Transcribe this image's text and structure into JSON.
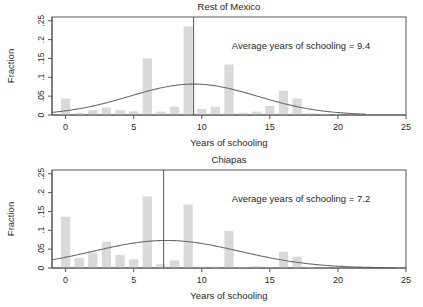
{
  "figure": {
    "width": 423,
    "height": 307,
    "background": "#ffffff",
    "bar_color": "#d9d9d9",
    "line_color": "#6b6b6b",
    "axis_color": "#555555",
    "text_color": "#1f1f1f"
  },
  "chart_data": [
    {
      "type": "bar",
      "panel_id": "rest-of-mexico",
      "title": "Rest of Mexico",
      "xlabel": "Years of schooling",
      "ylabel": "Fraction",
      "xlim": [
        -1,
        25
      ],
      "ylim": [
        0,
        0.26
      ],
      "xticks": [
        0,
        5,
        10,
        15,
        20,
        25
      ],
      "xtick_labels": [
        "0",
        "5",
        "10",
        "15",
        "20",
        "25"
      ],
      "yticks": [
        0,
        0.05,
        0.1,
        0.15,
        0.2,
        0.25
      ],
      "ytick_labels": [
        "0",
        ".05",
        ".1",
        ".15",
        ".2",
        ".25"
      ],
      "grid": false,
      "legend": "none",
      "annotation": "Average years of schooling = 9.4",
      "annotation_x": 12.2,
      "annotation_y": 0.175,
      "mean_line_x": 9.4,
      "bin_width": 1,
      "categories": [
        0,
        1,
        2,
        3,
        4,
        5,
        6,
        7,
        8,
        9,
        10,
        11,
        12,
        13,
        14,
        15,
        16,
        17,
        18,
        19,
        20,
        21,
        22,
        23,
        24
      ],
      "values": [
        0.044,
        0.006,
        0.013,
        0.02,
        0.013,
        0.01,
        0.15,
        0.009,
        0.022,
        0.235,
        0.016,
        0.022,
        0.134,
        0.006,
        0.009,
        0.024,
        0.064,
        0.044,
        0.005,
        0.003,
        0.002,
        0.001,
        0.0,
        0.0,
        0.0
      ],
      "density_curve": {
        "name": "Normal density overlay",
        "mean": 9.4,
        "sd": 4.7,
        "peak_value": 0.082,
        "x_start": -1,
        "x_end": 22
      }
    },
    {
      "type": "bar",
      "panel_id": "chiapas",
      "title": "Chiapas",
      "xlabel": "Years of schooling",
      "ylabel": "Fraction",
      "xlim": [
        -1,
        25
      ],
      "ylim": [
        0,
        0.26
      ],
      "xticks": [
        0,
        5,
        10,
        15,
        20,
        25
      ],
      "xtick_labels": [
        "0",
        "5",
        "10",
        "15",
        "20",
        "25"
      ],
      "yticks": [
        0,
        0.05,
        0.1,
        0.15,
        0.2,
        0.25
      ],
      "ytick_labels": [
        "0",
        ".05",
        ".1",
        ".15",
        ".2",
        ".25"
      ],
      "grid": false,
      "legend": "none",
      "annotation": "Average years of schooling = 7.2",
      "annotation_x": 12.2,
      "annotation_y": 0.175,
      "mean_line_x": 7.2,
      "bin_width": 1,
      "categories": [
        0,
        1,
        2,
        3,
        4,
        5,
        6,
        7,
        8,
        9,
        10,
        11,
        12,
        13,
        14,
        15,
        16,
        17,
        18,
        19,
        20,
        21,
        22,
        23,
        24
      ],
      "values": [
        0.136,
        0.026,
        0.041,
        0.07,
        0.035,
        0.023,
        0.19,
        0.01,
        0.02,
        0.168,
        0.004,
        0.004,
        0.098,
        0.003,
        0.005,
        0.003,
        0.043,
        0.03,
        0.003,
        0.001,
        0.001,
        0.0,
        0.0,
        0.0,
        0.0
      ],
      "density_curve": {
        "name": "Normal density overlay",
        "mean": 7.4,
        "sd": 5.4,
        "peak_value": 0.073,
        "x_start": -1,
        "x_end": 24.2
      }
    }
  ]
}
